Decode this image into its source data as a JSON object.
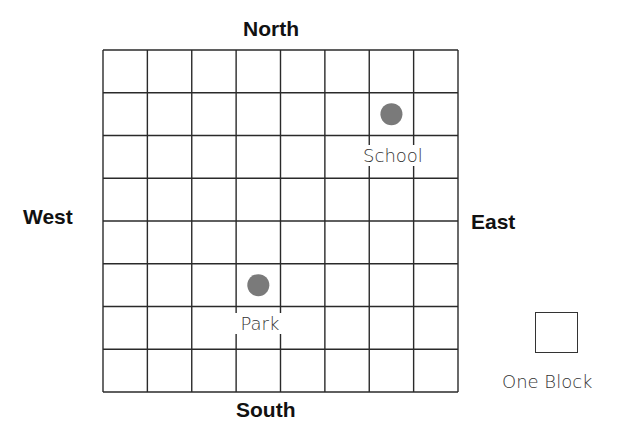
{
  "map": {
    "grid": {
      "columns": 8,
      "rows": 8
    },
    "directions": {
      "north": "North",
      "south": "South",
      "west": "West",
      "east": "East"
    },
    "landmarks": [
      {
        "name": "School",
        "column": 7,
        "row": 2,
        "color": "#7a7a7a"
      },
      {
        "name": "Park",
        "column": 4,
        "row": 6,
        "color": "#7a7a7a"
      }
    ],
    "legend": {
      "label": "One Block"
    }
  }
}
